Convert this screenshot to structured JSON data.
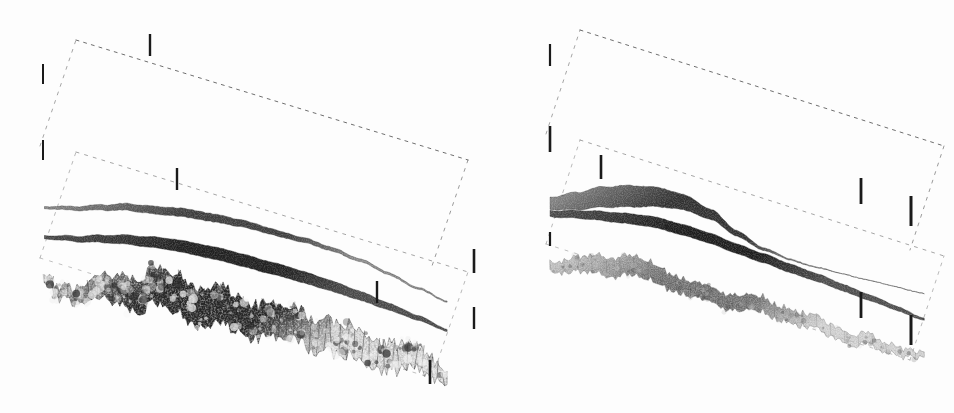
{
  "figure": {
    "kind": "scanned-scientific-figure",
    "background_color": "#fdfdfd",
    "ink_color": "#1a1a1a",
    "width": 954,
    "height": 413,
    "panel_count": 2
  },
  "chart_data": {
    "type": "surface3d",
    "title": "",
    "subtitle": "",
    "xlabel": "",
    "ylabel": "",
    "zlabel": "",
    "grid": false,
    "legend": "none",
    "annotations": [],
    "projection": {
      "style": "oblique-perspective",
      "x_axis_screen_vector": [
        1.0,
        -0.3
      ],
      "y_axis_screen_vector": [
        0.62,
        0.58
      ],
      "z_axis_screen_vector": [
        0.0,
        -1.0
      ]
    },
    "axes": {
      "x_range": [
        0,
        1
      ],
      "y_range": [
        0,
        1
      ],
      "z_range": [
        0,
        1
      ],
      "tick_count_x": 3,
      "tick_count_y": 3,
      "tick_count_z": 3,
      "tick_labels_x": [],
      "tick_labels_y": [],
      "tick_labels_z": [],
      "box_line_style": "dashed",
      "box_line_color": "#4a4a4a"
    },
    "panels": [
      {
        "name": "left-panel",
        "index": 0,
        "origin": [
          18,
          20
        ],
        "size": [
          462,
          380
        ],
        "box": {
          "front_bottom_left": [
            40,
            258
          ],
          "front_bottom_right": [
            432,
            378
          ],
          "back_bottom_right": [
            470,
            262
          ],
          "back_bottom_left": [
            76,
            152
          ],
          "top_offset_z": 112
        },
        "ticks": [
          {
            "name": "tick-left-upper",
            "x": 43,
            "y": 64,
            "length": 20,
            "weight": 2.0
          },
          {
            "name": "tick-left-mid",
            "x": 43,
            "y": 140,
            "length": 20,
            "weight": 2.0
          },
          {
            "name": "tick-back-top",
            "x": 150,
            "y": 34,
            "length": 22,
            "weight": 2.4
          },
          {
            "name": "tick-mid-front",
            "x": 177,
            "y": 168,
            "length": 22,
            "weight": 2.4
          },
          {
            "name": "tick-right-upper",
            "x": 474,
            "y": 249,
            "length": 24,
            "weight": 2.6
          },
          {
            "name": "tick-center-low",
            "x": 377,
            "y": 281,
            "length": 22,
            "weight": 2.4
          },
          {
            "name": "tick-right-low",
            "x": 474,
            "y": 307,
            "length": 22,
            "weight": 2.4
          },
          {
            "name": "tick-right-bottom",
            "x": 430,
            "y": 360,
            "length": 24,
            "weight": 2.6
          }
        ],
        "surfaces": [
          {
            "name": "upper-surface",
            "index": 0,
            "role": "top interface",
            "shading": "gradient-gray",
            "fill_light": "#8f8f8f",
            "fill_dark": "#3b3b3b",
            "roughness": 0.06,
            "mean_height": 0.82,
            "profile": [
              0.3,
              0.42,
              0.58,
              0.72,
              0.8,
              0.86,
              0.88,
              0.87,
              0.84,
              0.8,
              0.74,
              0.62,
              0.48,
              0.32,
              0.18
            ],
            "thickness": [
              0.04,
              0.07,
              0.1,
              0.13,
              0.15,
              0.16,
              0.15,
              0.13,
              0.11,
              0.09,
              0.07,
              0.05,
              0.04,
              0.03,
              0.02
            ]
          },
          {
            "name": "middle-surface",
            "index": 1,
            "role": "middle interface",
            "shading": "solid-dark",
            "fill_light": "#4a4a4a",
            "fill_dark": "#1c1c1c",
            "roughness": 0.04,
            "mean_height": 0.5,
            "profile": [
              0.34,
              0.46,
              0.6,
              0.72,
              0.8,
              0.84,
              0.85,
              0.83,
              0.8,
              0.75,
              0.69,
              0.6,
              0.5,
              0.38,
              0.24
            ],
            "thickness": [
              0.06,
              0.1,
              0.14,
              0.18,
              0.21,
              0.23,
              0.24,
              0.24,
              0.23,
              0.22,
              0.2,
              0.17,
              0.13,
              0.09,
              0.04
            ]
          },
          {
            "name": "lower-rough-surface",
            "index": 2,
            "role": "bottom rough interface",
            "shading": "high-contrast-texture",
            "fill_light": "#f2f2f2",
            "fill_dark": "#2a2a2a",
            "roughness": 0.95,
            "mean_height": 0.3,
            "profile": [
              0.22,
              0.36,
              0.55,
              0.72,
              0.84,
              0.9,
              0.88,
              0.8,
              0.72,
              0.68,
              0.66,
              0.62,
              0.55,
              0.44,
              0.28
            ],
            "thickness": [
              0.1,
              0.22,
              0.4,
              0.56,
              0.66,
              0.7,
              0.68,
              0.62,
              0.58,
              0.56,
              0.55,
              0.52,
              0.46,
              0.36,
              0.2
            ]
          }
        ]
      },
      {
        "name": "right-panel",
        "index": 1,
        "origin": [
          500,
          10
        ],
        "size": [
          452,
          390
        ],
        "box": {
          "front_bottom_left": [
            546,
            244
          ],
          "front_bottom_right": [
            910,
            360
          ],
          "back_bottom_right": [
            950,
            250
          ],
          "back_bottom_left": [
            580,
            140
          ],
          "top_offset_z": 110
        },
        "ticks": [
          {
            "name": "tick-left-upper",
            "x": 550,
            "y": 44,
            "length": 22,
            "weight": 2.2
          },
          {
            "name": "tick-left-mid",
            "x": 550,
            "y": 126,
            "length": 26,
            "weight": 2.6
          },
          {
            "name": "tick-mid-front",
            "x": 601,
            "y": 155,
            "length": 24,
            "weight": 2.6
          },
          {
            "name": "tick-right-upper",
            "x": 861,
            "y": 178,
            "length": 26,
            "weight": 2.8
          },
          {
            "name": "tick-right-edge",
            "x": 911,
            "y": 196,
            "length": 30,
            "weight": 3.0
          },
          {
            "name": "tick-right-low",
            "x": 861,
            "y": 292,
            "length": 26,
            "weight": 2.8
          },
          {
            "name": "tick-right-bottom",
            "x": 911,
            "y": 315,
            "length": 30,
            "weight": 3.0
          },
          {
            "name": "tick-bottom-left",
            "x": 550,
            "y": 232,
            "length": 14,
            "weight": 2.2
          }
        ],
        "surfaces": [
          {
            "name": "upper-surface",
            "index": 0,
            "role": "top interface",
            "shading": "gradient-gray",
            "fill_light": "#9a9a9a",
            "fill_dark": "#2e2e2e",
            "roughness": 0.05,
            "mean_height": 0.84,
            "profile": [
              0.22,
              0.44,
              0.66,
              0.82,
              0.9,
              0.88,
              0.7,
              0.4,
              0.18,
              0.08,
              0.04,
              0.02,
              0.01,
              0.0,
              0.0
            ],
            "thickness": [
              0.24,
              0.34,
              0.4,
              0.42,
              0.38,
              0.3,
              0.2,
              0.11,
              0.05,
              0.02,
              0.01,
              0.0,
              0.0,
              0.0,
              0.0
            ]
          },
          {
            "name": "middle-surface",
            "index": 1,
            "role": "middle interface",
            "shading": "solid-dark",
            "fill_light": "#4e4e4e",
            "fill_dark": "#1a1a1a",
            "roughness": 0.04,
            "mean_height": 0.52,
            "profile": [
              0.58,
              0.7,
              0.8,
              0.88,
              0.92,
              0.9,
              0.84,
              0.76,
              0.68,
              0.6,
              0.52,
              0.43,
              0.34,
              0.24,
              0.12
            ],
            "thickness": [
              0.12,
              0.15,
              0.18,
              0.2,
              0.21,
              0.21,
              0.2,
              0.19,
              0.18,
              0.17,
              0.15,
              0.13,
              0.11,
              0.08,
              0.04
            ]
          },
          {
            "name": "lower-rough-surface",
            "index": 2,
            "role": "bottom rough interface",
            "shading": "medium-texture",
            "fill_light": "#c9c9c9",
            "fill_dark": "#3a3a3a",
            "roughness": 0.45,
            "mean_height": 0.34,
            "profile": [
              0.38,
              0.56,
              0.72,
              0.8,
              0.74,
              0.62,
              0.56,
              0.58,
              0.56,
              0.48,
              0.4,
              0.34,
              0.3,
              0.24,
              0.14
            ],
            "thickness": [
              0.16,
              0.26,
              0.34,
              0.36,
              0.32,
              0.28,
              0.27,
              0.28,
              0.27,
              0.24,
              0.22,
              0.2,
              0.18,
              0.14,
              0.08
            ]
          }
        ]
      }
    ]
  }
}
